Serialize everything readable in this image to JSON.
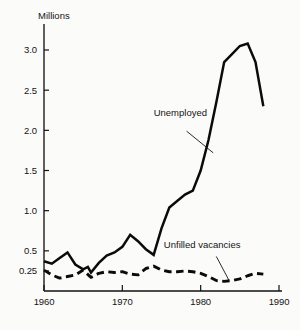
{
  "chart_data": {
    "type": "line",
    "title": "",
    "subtitle": "",
    "xlabel": "",
    "ylabel": "Millions",
    "ylabel_position": "top-left",
    "xlim": [
      1960,
      1990
    ],
    "ylim": [
      0.0,
      3.3
    ],
    "grid": false,
    "legend": "inline-annotations",
    "x_ticks": [
      "1960",
      "1970",
      "1980",
      "1990"
    ],
    "x_tick_values": [
      1960,
      1970,
      1980,
      1990
    ],
    "y_ticks": [
      "0.25",
      "0.5",
      "1.0",
      "1.5",
      "2.0",
      "2.5",
      "3.0"
    ],
    "y_tick_values": [
      0.25,
      0.5,
      1.0,
      1.5,
      2.0,
      2.5,
      3.0
    ],
    "annotations": [
      {
        "name": "unemployed",
        "text": "Unemployed",
        "x": 1974.0,
        "y": 2.18,
        "leader_from": [
          1978.2,
          1.99
        ],
        "leader_to": [
          1981.6,
          1.72
        ]
      },
      {
        "name": "unfilled-vacancies",
        "text": "Unfilled vacancies",
        "x": 1975.3,
        "y": 0.53,
        "leader_from": [
          1982.0,
          0.43
        ],
        "leader_to": [
          1983.6,
          0.135
        ]
      }
    ],
    "series": [
      {
        "name": "Unemployed",
        "style": "solid",
        "x": [
          1960,
          1961,
          1962,
          1963,
          1964,
          1965,
          1965.6,
          1966,
          1967,
          1968,
          1969,
          1970,
          1971,
          1972,
          1973,
          1974,
          1975,
          1976,
          1977,
          1978,
          1979,
          1980,
          1981,
          1982,
          1983,
          1984,
          1985,
          1986,
          1987,
          1988
        ],
        "values": [
          0.37,
          0.34,
          0.41,
          0.48,
          0.33,
          0.27,
          0.3,
          0.23,
          0.35,
          0.44,
          0.48,
          0.55,
          0.7,
          0.62,
          0.52,
          0.45,
          0.78,
          1.04,
          1.12,
          1.2,
          1.25,
          1.5,
          1.88,
          2.35,
          2.85,
          2.95,
          3.05,
          3.08,
          2.85,
          2.3
        ]
      },
      {
        "name": "Unfilled vacancies",
        "style": "dashed",
        "x": [
          1960,
          1961,
          1962,
          1963,
          1964,
          1965,
          1966,
          1967,
          1968,
          1969,
          1970,
          1971,
          1972,
          1973,
          1974,
          1975,
          1976,
          1977,
          1978,
          1979,
          1980,
          1981,
          1982,
          1983,
          1984,
          1985,
          1986,
          1987,
          1988
        ],
        "values": [
          0.26,
          0.2,
          0.16,
          0.18,
          0.2,
          0.26,
          0.17,
          0.22,
          0.24,
          0.23,
          0.24,
          0.21,
          0.2,
          0.28,
          0.31,
          0.26,
          0.24,
          0.24,
          0.25,
          0.24,
          0.22,
          0.18,
          0.13,
          0.12,
          0.13,
          0.15,
          0.19,
          0.22,
          0.21
        ]
      }
    ]
  }
}
